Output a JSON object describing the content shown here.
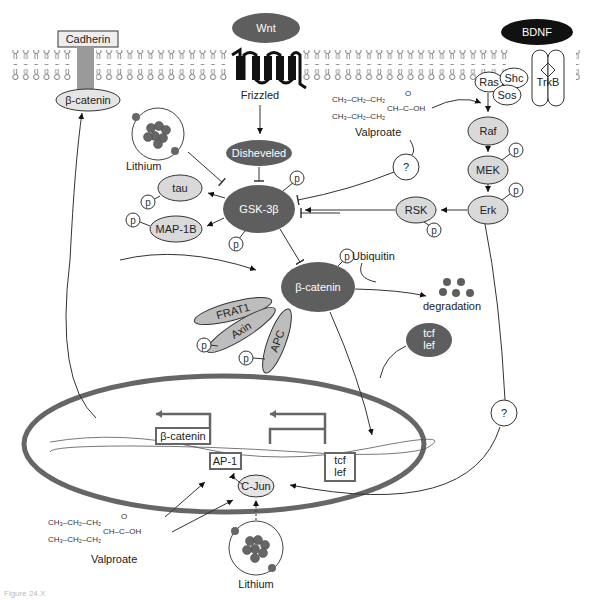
{
  "diagram": {
    "ligands": {
      "wnt": "Wnt",
      "bdnf": "BDNF"
    },
    "receptors": {
      "frizzled": "Frizzled",
      "trkb": "TrkB",
      "cadherin": "Cadherin"
    },
    "membrane_nodes": {
      "beta_catenin_membrane": "β-catenin",
      "ras": "Ras",
      "shc": "Shc",
      "sos": "Sos"
    },
    "cytoplasm_nodes": {
      "disheveled": "Disheveled",
      "gsk3b": "GSK-3β",
      "tau": "tau",
      "map1b": "MAP-1B",
      "raf": "Raf",
      "mek": "MEK",
      "erk": "Erk",
      "rsk": "RSK",
      "beta_catenin": "β-catenin",
      "frat1": "FRAT1",
      "axin": "Axin",
      "apc": "APC",
      "tcf_lef_line1": "tcf",
      "tcf_lef_line2": "lef",
      "ubiquitin": "Ubiquitin",
      "degradation": "degradation",
      "unknown_1": "?",
      "unknown_2": "?"
    },
    "phospho_label": "p",
    "drugs": {
      "lithium_top": "Lithium",
      "lithium_bottom": "Lithium",
      "valproate_top": "Valproate",
      "valproate_bottom": "Valproate",
      "valproate_formula": {
        "chain": "CH₃–CH₂–CH₂",
        "ch": "CH–C–OH",
        "o": "O"
      }
    },
    "nucleus": {
      "beta_catenin_box": "β-catenin",
      "ap1_box": "AP-1",
      "tcf_box_line1": "tcf",
      "tcf_box_line2": "lef",
      "cjun": "C-Jun"
    },
    "caption_fragment": "Figure 24.X"
  },
  "colors": {
    "dark_node": "#5e5e5e",
    "light_node": "#d9d9d9",
    "nucleus_border": "#666666",
    "black": "#111111",
    "line": "#333333"
  }
}
